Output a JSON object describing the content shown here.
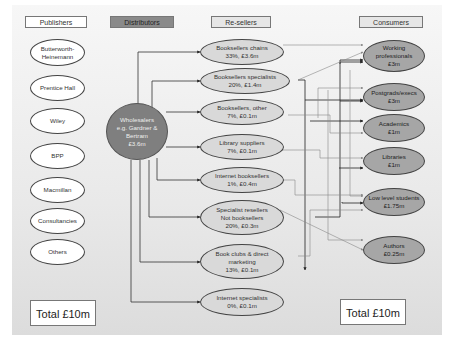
{
  "headers": {
    "publishers": "Publishers",
    "distributors": "Distributors",
    "resellers": "Re-sellers",
    "consumers": "Consumers"
  },
  "publishers": [
    "Butterworth-\nHeinemann",
    "Prentice Hall",
    "Wiley",
    "BPP",
    "Macmillan",
    "Consultancies",
    "Others"
  ],
  "distributor": {
    "label": "Wholesalers\ne.g. Gardner &\nBertram\n£3.6m"
  },
  "resellers": [
    "Booksellers chains\n33%, £3.6m",
    "Booksellers specialists\n20%, £1.4m",
    "Booksellers, other\n7%, £0.1m",
    "Library suppliers\n7%, £0.1m",
    "Internet booksellers\n1%, £0.4m",
    "Specialist resellers\nNot booksellers\n20%, £0.3m",
    "Book clubs & direct\nmarketing\n13%, £0.1m",
    "Internet specialists\n0%, £0.1m"
  ],
  "consumers": [
    "Working\nprofessionals\n£3m",
    "Postgrads/execs\n£3m",
    "Academics\n£1m",
    "Libraries\n£1m",
    "Low level students\n£1.75m",
    "Authors\n£0.25m"
  ],
  "totals": {
    "left": "Total £10m",
    "right": "Total £10m"
  },
  "colors": {
    "distributor_fill": "#7f7f7f",
    "reseller_fill": "#d9d9d9",
    "consumer_fill": "#a6a6a6",
    "publisher_fill": "#ffffff"
  }
}
